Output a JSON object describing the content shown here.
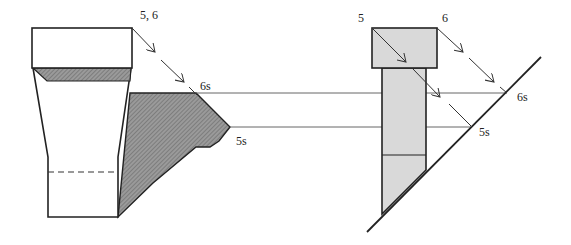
{
  "figure": {
    "left": {
      "top_label": "5, 6",
      "shadow_label_upper": "6s",
      "shadow_label_lower": "5s"
    },
    "right": {
      "corner_label_left": "5",
      "corner_label_right": "6",
      "shadow_label_upper": "6s",
      "shadow_label_lower": "5s"
    }
  },
  "colors": {
    "line": "#222222",
    "hatch_fill": "#8a8a8a",
    "light_fill": "#d9d9d9",
    "thin_line": "#555555"
  }
}
